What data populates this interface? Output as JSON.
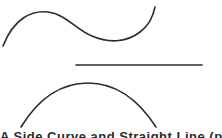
{
  "figure": {
    "stroke_color": "#2b2b2b",
    "shapes": [
      {
        "name": "s-curve",
        "type": "curve",
        "path": "M3,46 C14,18 32,10 48,12 C66,14 76,30 92,36 C108,43 126,43 140,32 C150,24 153,16 155,7"
      },
      {
        "name": "straight-line",
        "type": "line",
        "x1": 76,
        "y1": 65,
        "x2": 202,
        "y2": 65
      },
      {
        "name": "arc",
        "type": "curve",
        "path": "M21,127 C40,96 64,83 88,83 C112,83 136,96 156,127"
      }
    ],
    "caption": "A Side Curve and Straight Line (partially visible; text clipped)"
  }
}
